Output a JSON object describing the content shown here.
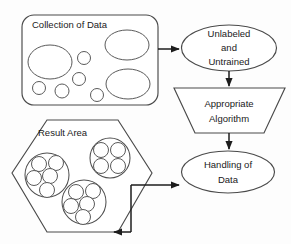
{
  "diagram": {
    "type": "flowchart",
    "background_color": "#fdfdfd",
    "stroke_color": "#4a4a4a",
    "connector_color": "#1c1c1c",
    "nodes": {
      "collection": {
        "label": "Collection of Data",
        "shape": "rounded-rectangle",
        "contents": "scattered unlabeled data blobs"
      },
      "unlabeled": {
        "shape": "ellipse",
        "line1": "Unlabeled",
        "line2": "and",
        "line3": "Untrained"
      },
      "algorithm": {
        "shape": "trapezoid",
        "line1": "Appropriate",
        "line2": "Algorithm"
      },
      "handling": {
        "shape": "ellipse",
        "line1": "Handling of",
        "line2": "Data"
      },
      "result": {
        "label": "Result Area",
        "shape": "hexagon",
        "contents": "three grouped clusters of data points"
      }
    },
    "edges": [
      {
        "name": "collection-to-unlabeled",
        "from": "collection",
        "to": "unlabeled",
        "style": "arrow"
      },
      {
        "name": "unlabeled-to-algorithm",
        "from": "unlabeled",
        "to": "algorithm",
        "style": "arrow"
      },
      {
        "name": "algorithm-to-handling",
        "from": "algorithm",
        "to": "handling",
        "style": "arrow"
      },
      {
        "name": "handling-to-result",
        "from": "handling",
        "to": "result",
        "style": "arrow"
      }
    ],
    "collection_blobs": [
      {
        "name": "blob-left-large",
        "cx": 50,
        "cy": 62,
        "rx": 22,
        "ry": 17
      },
      {
        "name": "blob-top-right",
        "cx": 127,
        "cy": 45,
        "rx": 22,
        "ry": 15
      },
      {
        "name": "blob-bottom-right",
        "cx": 128,
        "cy": 84,
        "rx": 22,
        "ry": 15
      },
      {
        "name": "blob-small-1",
        "cx": 84,
        "cy": 58,
        "rx": 6.5,
        "ry": 6.5
      },
      {
        "name": "blob-small-2",
        "cx": 79,
        "cy": 79,
        "rx": 6.5,
        "ry": 6.5
      },
      {
        "name": "blob-small-3",
        "cx": 39,
        "cy": 88,
        "rx": 6.5,
        "ry": 6.5
      },
      {
        "name": "blob-small-4",
        "cx": 62,
        "cy": 91,
        "rx": 7,
        "ry": 7
      },
      {
        "name": "blob-small-5",
        "cx": 97,
        "cy": 95,
        "rx": 6.5,
        "ry": 6.5
      }
    ],
    "result_clusters": [
      {
        "name": "cluster-left",
        "cx": 47,
        "cy": 175,
        "r": 22,
        "points": [
          {
            "cx": 39,
            "cy": 164,
            "r": 7.5
          },
          {
            "cx": 56,
            "cy": 163,
            "r": 7.5
          },
          {
            "cx": 34,
            "cy": 178,
            "r": 7.5
          },
          {
            "cx": 50,
            "cy": 176,
            "r": 7.5
          },
          {
            "cx": 47,
            "cy": 190,
            "r": 7.5
          }
        ]
      },
      {
        "name": "cluster-top-right",
        "cx": 110,
        "cy": 158,
        "r": 20,
        "points": [
          {
            "cx": 101,
            "cy": 150,
            "r": 7.5
          },
          {
            "cx": 118,
            "cy": 150,
            "r": 7.5
          },
          {
            "cx": 101,
            "cy": 166,
            "r": 7.5
          },
          {
            "cx": 118,
            "cy": 166,
            "r": 7.5
          }
        ]
      },
      {
        "name": "cluster-bottom",
        "cx": 84,
        "cy": 202,
        "r": 22,
        "points": [
          {
            "cx": 76,
            "cy": 192,
            "r": 7.5
          },
          {
            "cx": 93,
            "cy": 191,
            "r": 7.5
          },
          {
            "cx": 71,
            "cy": 206,
            "r": 7.5
          },
          {
            "cx": 87,
            "cy": 204,
            "r": 7.5
          },
          {
            "cx": 83,
            "cy": 217,
            "r": 7.5
          }
        ]
      }
    ]
  }
}
